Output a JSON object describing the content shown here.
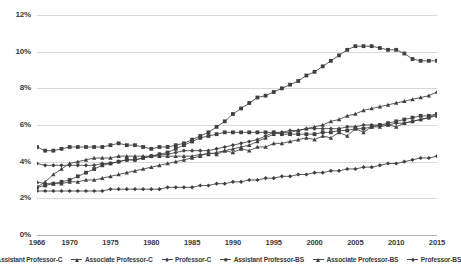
{
  "chart_data": {
    "type": "line",
    "title": "",
    "xlabel": "",
    "ylabel": "",
    "grid": true,
    "legend_position": "bottom",
    "ylim": [
      0,
      12
    ],
    "ytick_labels": [
      "0%",
      "2%",
      "4%",
      "6%",
      "8%",
      "10%",
      "12%"
    ],
    "ytick_values": [
      0,
      2,
      4,
      6,
      8,
      10,
      12
    ],
    "xlim": [
      1966,
      2015
    ],
    "xtick_labels": [
      "1966",
      "1970",
      "1975",
      "1980",
      "1985",
      "1990",
      "1995",
      "2000",
      "2005",
      "2010",
      "2015"
    ],
    "xtick_values": [
      1966,
      1970,
      1975,
      1980,
      1985,
      1990,
      1995,
      2000,
      2005,
      2010,
      2015
    ],
    "x": [
      1966,
      1967,
      1968,
      1969,
      1970,
      1971,
      1972,
      1973,
      1974,
      1975,
      1976,
      1977,
      1978,
      1979,
      1980,
      1981,
      1982,
      1983,
      1984,
      1985,
      1986,
      1987,
      1988,
      1989,
      1990,
      1991,
      1992,
      1993,
      1994,
      1995,
      1996,
      1997,
      1998,
      1999,
      2000,
      2001,
      2002,
      2003,
      2004,
      2005,
      2006,
      2007,
      2008,
      2009,
      2010,
      2011,
      2012,
      2013,
      2014,
      2015
    ],
    "series": [
      {
        "name": "Assistant Professor-C",
        "marker": "square",
        "color": "#404040",
        "values": [
          4.8,
          4.6,
          4.6,
          4.7,
          4.8,
          4.8,
          4.8,
          4.8,
          4.8,
          4.9,
          5.0,
          4.9,
          4.9,
          4.8,
          4.7,
          4.8,
          4.8,
          4.9,
          5.0,
          5.2,
          5.4,
          5.6,
          5.9,
          6.2,
          6.6,
          6.9,
          7.2,
          7.5,
          7.6,
          7.8,
          8.0,
          8.2,
          8.4,
          8.7,
          8.9,
          9.2,
          9.5,
          9.8,
          10.1,
          10.3,
          10.3,
          10.3,
          10.2,
          10.1,
          10.1,
          9.9,
          9.6,
          9.5,
          9.5,
          9.5
        ]
      },
      {
        "name": "Associate Professor-C",
        "marker": "triangle",
        "color": "#404040",
        "values": [
          2.6,
          2.9,
          3.3,
          3.6,
          3.9,
          4.0,
          4.1,
          4.2,
          4.2,
          4.2,
          4.3,
          4.3,
          4.3,
          4.3,
          4.3,
          4.3,
          4.3,
          4.3,
          4.3,
          4.3,
          4.4,
          4.4,
          4.5,
          4.6,
          4.7,
          4.8,
          4.9,
          5.1,
          5.3,
          5.5,
          5.6,
          5.6,
          5.7,
          5.8,
          5.9,
          6.0,
          6.2,
          6.3,
          6.5,
          6.6,
          6.8,
          6.9,
          7.0,
          7.1,
          7.2,
          7.3,
          7.4,
          7.5,
          7.6,
          7.8
        ]
      },
      {
        "name": "Professor-C",
        "marker": "diamond",
        "color": "#404040",
        "values": [
          3.9,
          3.8,
          3.8,
          3.8,
          3.8,
          3.8,
          3.8,
          3.8,
          3.9,
          3.9,
          4.0,
          4.1,
          4.1,
          4.2,
          4.3,
          4.4,
          4.4,
          4.5,
          4.6,
          4.6,
          4.6,
          4.6,
          4.7,
          4.8,
          4.9,
          5.0,
          5.1,
          5.2,
          5.4,
          5.6,
          5.6,
          5.7,
          5.7,
          5.8,
          5.8,
          5.8,
          5.8,
          5.8,
          5.9,
          5.9,
          6.0,
          6.0,
          6.0,
          6.0,
          6.1,
          6.1,
          6.2,
          6.3,
          6.4,
          6.6
        ]
      },
      {
        "name": "Assistant Professor-BS",
        "marker": "square",
        "color": "#404040",
        "values": [
          2.6,
          2.7,
          2.8,
          2.9,
          3.0,
          3.2,
          3.4,
          3.6,
          3.8,
          3.9,
          4.0,
          4.1,
          4.1,
          4.2,
          4.3,
          4.4,
          4.5,
          4.7,
          4.9,
          5.1,
          5.3,
          5.4,
          5.5,
          5.6,
          5.6,
          5.6,
          5.6,
          5.6,
          5.6,
          5.6,
          5.5,
          5.5,
          5.5,
          5.5,
          5.5,
          5.6,
          5.6,
          5.7,
          5.7,
          5.8,
          5.8,
          5.9,
          6.0,
          6.1,
          6.2,
          6.3,
          6.4,
          6.5,
          6.5,
          6.6
        ]
      },
      {
        "name": "Associate Professor-BS",
        "marker": "triangle",
        "color": "#404040",
        "values": [
          2.9,
          2.8,
          2.8,
          2.8,
          2.9,
          2.9,
          3.0,
          3.0,
          3.1,
          3.2,
          3.3,
          3.4,
          3.5,
          3.6,
          3.7,
          3.8,
          3.9,
          4.0,
          4.1,
          4.2,
          4.3,
          4.5,
          4.4,
          4.6,
          4.5,
          4.7,
          4.6,
          4.8,
          4.8,
          5.0,
          5.0,
          5.1,
          5.2,
          5.3,
          5.2,
          5.4,
          5.3,
          5.6,
          5.4,
          5.8,
          5.6,
          5.9,
          5.9,
          6.0,
          5.9,
          6.1,
          6.2,
          6.3,
          6.4,
          6.5
        ]
      },
      {
        "name": "Professor-BS",
        "marker": "diamond",
        "color": "#404040",
        "values": [
          2.4,
          2.4,
          2.4,
          2.4,
          2.4,
          2.4,
          2.4,
          2.4,
          2.4,
          2.5,
          2.5,
          2.5,
          2.5,
          2.5,
          2.5,
          2.5,
          2.6,
          2.6,
          2.6,
          2.6,
          2.7,
          2.7,
          2.8,
          2.8,
          2.9,
          2.9,
          3.0,
          3.0,
          3.1,
          3.1,
          3.2,
          3.2,
          3.3,
          3.3,
          3.4,
          3.4,
          3.5,
          3.5,
          3.6,
          3.6,
          3.7,
          3.7,
          3.8,
          3.9,
          3.9,
          4.0,
          4.1,
          4.2,
          4.2,
          4.3
        ]
      }
    ]
  }
}
